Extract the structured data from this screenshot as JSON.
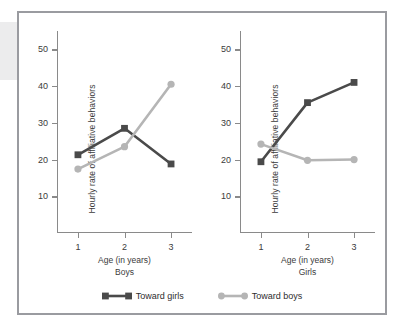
{
  "figure": {
    "legend": [
      {
        "label": "Toward girls",
        "color": "#4a4a4a",
        "marker": "square"
      },
      {
        "label": "Toward boys",
        "color": "#b5b5b5",
        "marker": "circle"
      }
    ]
  },
  "chart_data": [
    {
      "type": "line",
      "title": "",
      "panel_label": "Boys",
      "xlabel": "Age (in years)",
      "ylabel": "Hourly rate of affiliative behaviors",
      "categories": [
        "1",
        "2",
        "3"
      ],
      "x": [
        1,
        2,
        3
      ],
      "xlim": [
        0.55,
        3.45
      ],
      "ylim": [
        0,
        55
      ],
      "yticks": [
        10,
        20,
        30,
        40,
        50
      ],
      "xticks": [
        1,
        2,
        3
      ],
      "grid": false,
      "legend_position": "bottom-center",
      "series": [
        {
          "name": "Toward girls",
          "color": "#4a4a4a",
          "marker": "square",
          "values": [
            21.3,
            28.5,
            18.8
          ]
        },
        {
          "name": "Toward boys",
          "color": "#b5b5b5",
          "marker": "circle",
          "values": [
            17.4,
            23.5,
            40.5
          ]
        }
      ]
    },
    {
      "type": "line",
      "title": "",
      "panel_label": "Girls",
      "xlabel": "Age (in years)",
      "ylabel": "Hourly rate of affiliative behaviors",
      "categories": [
        "1",
        "2",
        "3"
      ],
      "x": [
        1,
        2,
        3
      ],
      "xlim": [
        0.55,
        3.45
      ],
      "ylim": [
        0,
        55
      ],
      "yticks": [
        10,
        20,
        30,
        40,
        50
      ],
      "xticks": [
        1,
        2,
        3
      ],
      "grid": false,
      "legend_position": "bottom-center",
      "series": [
        {
          "name": "Toward girls",
          "color": "#4a4a4a",
          "marker": "square",
          "values": [
            19.4,
            35.5,
            41.0
          ]
        },
        {
          "name": "Toward boys",
          "color": "#b5b5b5",
          "marker": "circle",
          "values": [
            24.2,
            19.8,
            20.0
          ]
        }
      ]
    }
  ]
}
